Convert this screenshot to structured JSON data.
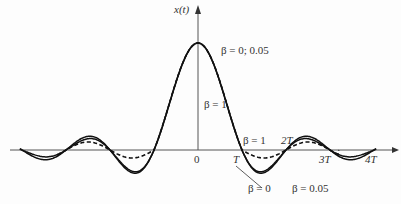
{
  "chart_data": {
    "type": "line",
    "title": "",
    "xlabel": "t",
    "ylabel": "x(t)",
    "x_ticks": [
      "0",
      "T",
      "2T",
      "3T",
      "4T"
    ],
    "x_range_T": [
      -4,
      4
    ],
    "y_peak": 1,
    "series": [
      {
        "name": "β = 0",
        "style": "solid",
        "beta": 0
      },
      {
        "name": "β = 0.05",
        "style": "solid",
        "beta": 0.05
      },
      {
        "name": "β = 1",
        "style": "dashed",
        "beta": 1
      }
    ],
    "annotations": [
      {
        "text": "β = 0; 0.05",
        "near": "peak"
      },
      {
        "text": "β = 1",
        "near": "main lobe right side"
      },
      {
        "text": "β = 1",
        "near": "between T and 2T"
      },
      {
        "text": "β = 0",
        "near": "below T"
      },
      {
        "text": "β = 0.05",
        "near": "below 2T with pointer"
      }
    ]
  },
  "labels": {
    "y_axis": "x(t)",
    "origin": "0",
    "T": "T",
    "2T": "2T",
    "3T": "3T",
    "4T": "4T",
    "beta_peak": "β = 0; 0.05",
    "beta1_main": "β = 1",
    "beta1_side": "β = 1",
    "beta0": "β = 0",
    "beta005": "β = 0.05"
  }
}
